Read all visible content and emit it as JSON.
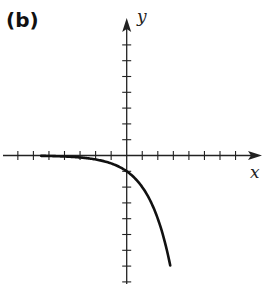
{
  "panel_label": "(b)",
  "colors": {
    "axis": "#222222",
    "curve": "#111111",
    "background": "#ffffff"
  },
  "chart_data": {
    "type": "line",
    "title": "(b)",
    "xlabel": "x",
    "ylabel": "y",
    "function": "y = -2^x",
    "grid": false,
    "x_ticks": [
      -7,
      -6,
      -5,
      -4,
      -3,
      -2,
      -1,
      1,
      2,
      3,
      4,
      5,
      6,
      7
    ],
    "y_ticks": [
      -8,
      -7,
      -6,
      -5,
      -4,
      -3,
      -2,
      -1,
      1,
      2,
      3,
      4,
      5,
      6,
      7
    ],
    "xlim": [
      -8,
      8.5
    ],
    "ylim": [
      -8.2,
      8.8
    ],
    "tick_labels_shown": false,
    "series": [
      {
        "name": "curve",
        "x": [
          -5.5,
          -5,
          -4,
          -3,
          -2,
          -1,
          0,
          0.5,
          1,
          1.5,
          2,
          2.5,
          2.8
        ],
        "y": [
          -0.02,
          -0.03,
          -0.06,
          -0.13,
          -0.25,
          -0.5,
          -1,
          -1.41,
          -2,
          -2.83,
          -4,
          -5.66,
          -6.96
        ]
      }
    ],
    "y_intercept": -1,
    "asymptote": "y = 0 as x → -∞"
  }
}
